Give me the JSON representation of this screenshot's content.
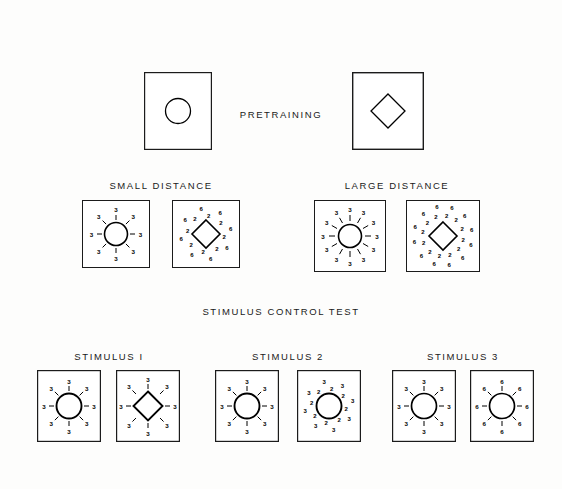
{
  "figure": {
    "background_color": "#fdfdfc",
    "ink_color": "#000000",
    "width": 562,
    "height": 489
  },
  "labels": {
    "pretraining": "PRETRAINING",
    "small_distance": "SMALL  DISTANCE",
    "large_distance": "LARGE  DISTANCE",
    "stimulus_control_test": "STIMULUS  CONTROL  TEST",
    "stimulus_1": "STIMULUS  I",
    "stimulus_2": "STIMULUS  2",
    "stimulus_3": "STIMULUS  3"
  },
  "rows": {
    "pretraining": {
      "label": "PRETRAINING",
      "panels": [
        {
          "id": "pretraining-circle",
          "shape": "circle",
          "x": 144,
          "y": 72,
          "w": 68,
          "h": 78,
          "shape_radius": 12.5,
          "shape_stroke": 1.3,
          "frame_stroke": 1.2,
          "markers": []
        },
        {
          "id": "pretraining-diamond",
          "shape": "diamond",
          "x": 352,
          "y": 72,
          "w": 72,
          "h": 78,
          "shape_radius": 17,
          "shape_stroke": 1.3,
          "frame_stroke": 1.4,
          "markers": []
        }
      ]
    },
    "distance": {
      "small_label": "SMALL  DISTANCE",
      "large_label": "LARGE  DISTANCE",
      "panels": [
        {
          "id": "small-distance-circle",
          "shape": "circle",
          "x": 82,
          "y": 200,
          "w": 68,
          "h": 68,
          "shape_radius": 11.5,
          "shape_stroke": 1.6,
          "frame_stroke": 1.0,
          "marker_count": 8,
          "tick_inner": 14,
          "tick_outer": 19,
          "label_radius": 24.5,
          "label_values": [
            "3"
          ],
          "label_font": 6.2
        },
        {
          "id": "small-distance-diamond",
          "shape": "diamond",
          "x": 172,
          "y": 200,
          "w": 68,
          "h": 68,
          "shape_radius": 14,
          "shape_stroke": 1.6,
          "frame_stroke": 1.0,
          "marker_count": 8,
          "tick_inner": 0,
          "tick_outer": 0,
          "label_radius": 22,
          "label_values": [
            "6",
            "2"
          ],
          "label_font": 6.0,
          "pair_offset": 5.0
        },
        {
          "id": "large-distance-circle",
          "shape": "circle",
          "x": 314,
          "y": 200,
          "w": 72,
          "h": 72,
          "shape_radius": 11.5,
          "shape_stroke": 1.6,
          "frame_stroke": 1.0,
          "marker_count": 12,
          "tick_inner": 15,
          "tick_outer": 21,
          "label_radius": 27,
          "label_values": [
            "3"
          ],
          "label_font": 6.2
        },
        {
          "id": "large-distance-diamond",
          "shape": "diamond",
          "x": 406,
          "y": 200,
          "w": 74,
          "h": 72,
          "shape_radius": 14,
          "shape_stroke": 1.6,
          "frame_stroke": 1.0,
          "marker_count": 12,
          "tick_inner": 0,
          "tick_outer": 0,
          "label_radius": 25,
          "label_values": [
            "6",
            "2"
          ],
          "label_font": 6.0,
          "pair_offset": 6.5
        }
      ]
    },
    "stimulus_control": {
      "heading": "STIMULUS  CONTROL  TEST",
      "groups": [
        {
          "id": "stimulus-1",
          "label": "STIMULUS  I",
          "panels": [
            {
              "id": "stimulus-1-circle",
              "shape": "circle",
              "x": 37,
              "y": 370,
              "w": 64,
              "h": 72,
              "shape_radius": 12.5,
              "shape_stroke": 1.9,
              "frame_stroke": 1.2,
              "marker_count": 8,
              "tick_inner": 15,
              "tick_outer": 20,
              "label_radius": 25,
              "label_values": [
                "3"
              ],
              "label_font": 6.2
            },
            {
              "id": "stimulus-1-diamond",
              "shape": "diamond",
              "x": 116,
              "y": 370,
              "w": 64,
              "h": 72,
              "shape_radius": 14.5,
              "shape_stroke": 1.9,
              "frame_stroke": 1.2,
              "marker_count": 8,
              "tick_inner": 17,
              "tick_outer": 22,
              "label_radius": 27,
              "label_values": [
                "3"
              ],
              "label_font": 6.2
            }
          ]
        },
        {
          "id": "stimulus-2",
          "label": "STIMULUS  2",
          "panels": [
            {
              "id": "stimulus-2-circle-a",
              "shape": "circle",
              "x": 215,
              "y": 370,
              "w": 64,
              "h": 72,
              "shape_radius": 12.5,
              "shape_stroke": 1.9,
              "frame_stroke": 1.2,
              "marker_count": 8,
              "tick_inner": 15,
              "tick_outer": 20,
              "label_radius": 25,
              "label_values": [
                "3"
              ],
              "label_font": 6.2
            },
            {
              "id": "stimulus-2-circle-b",
              "shape": "circle",
              "x": 297,
              "y": 370,
              "w": 64,
              "h": 72,
              "shape_radius": 12.5,
              "shape_stroke": 1.9,
              "frame_stroke": 1.2,
              "marker_count": 8,
              "tick_inner": 0,
              "tick_outer": 0,
              "label_radius": 21,
              "label_values": [
                "3",
                "2"
              ],
              "label_font": 6.0,
              "pair_offset": 5.0
            }
          ]
        },
        {
          "id": "stimulus-3",
          "label": "STIMULUS  3",
          "panels": [
            {
              "id": "stimulus-3-circle-a",
              "shape": "circle",
              "x": 392,
              "y": 370,
              "w": 64,
              "h": 72,
              "shape_radius": 12.5,
              "shape_stroke": 1.7,
              "frame_stroke": 1.2,
              "marker_count": 8,
              "tick_inner": 15,
              "tick_outer": 20,
              "label_radius": 25,
              "label_values": [
                "3"
              ],
              "label_font": 6.2
            },
            {
              "id": "stimulus-3-circle-b",
              "shape": "circle",
              "x": 470,
              "y": 370,
              "w": 64,
              "h": 72,
              "shape_radius": 12.5,
              "shape_stroke": 1.7,
              "frame_stroke": 1.2,
              "marker_count": 8,
              "tick_inner": 15,
              "tick_outer": 20,
              "label_radius": 25,
              "label_values": [
                "6"
              ],
              "label_font": 6.2
            }
          ]
        }
      ]
    }
  },
  "text_positions": {
    "pretraining": {
      "x": 281,
      "y": 115
    },
    "small_distance": {
      "x": 161,
      "y": 186
    },
    "large_distance": {
      "x": 397,
      "y": 186
    },
    "stimulus_control_test": {
      "x": 281,
      "y": 312
    },
    "stimulus_1": {
      "x": 109,
      "y": 357
    },
    "stimulus_2": {
      "x": 288,
      "y": 357
    },
    "stimulus_3": {
      "x": 463,
      "y": 357
    }
  }
}
